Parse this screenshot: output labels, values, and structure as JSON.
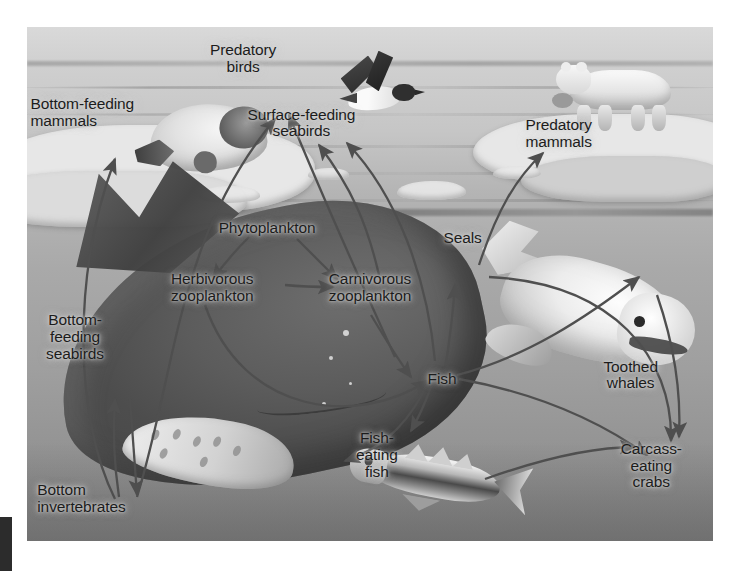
{
  "figure": {
    "kind": "illustration-diagram",
    "style": "grayscale photo-illustration with overlaid text labels and curved arrows"
  },
  "labels": [
    {
      "id": "predatory-birds",
      "text": "Predatory\nbirds",
      "x": 31.5,
      "y": 3.0,
      "align": "center"
    },
    {
      "id": "bottom-feeding-mammals",
      "text": "Bottom-feeding\nmammals",
      "x": 0.5,
      "y": 13.5,
      "align": "left"
    },
    {
      "id": "surface-feeding-seabirds",
      "text": "Surface-feeding\nseabirds",
      "x": 40.0,
      "y": 15.5,
      "align": "center"
    },
    {
      "id": "predatory-mammals",
      "text": "Predatory\nmammals",
      "x": 77.5,
      "y": 17.5,
      "align": "center"
    },
    {
      "id": "phytoplankton",
      "text": "Phytoplankton",
      "x": 35.0,
      "y": 37.5,
      "align": "center"
    },
    {
      "id": "seals",
      "text": "Seals",
      "x": 63.5,
      "y": 39.5,
      "align": "center"
    },
    {
      "id": "herbivorous-zooplankton",
      "text": "Herbivorous\nzooplankton",
      "x": 27.0,
      "y": 47.5,
      "align": "center"
    },
    {
      "id": "carnivorous-zooplankton",
      "text": "Carnivorous\nzooplankton",
      "x": 50.0,
      "y": 47.5,
      "align": "center"
    },
    {
      "id": "bottom-feeding-seabirds",
      "text": "Bottom-\nfeeding\nseabirds",
      "x": 7.0,
      "y": 55.5,
      "align": "center"
    },
    {
      "id": "fish",
      "text": "Fish",
      "x": 60.5,
      "y": 67.0,
      "align": "center"
    },
    {
      "id": "toothed-whales",
      "text": "Toothed\nwhales",
      "x": 88.0,
      "y": 64.5,
      "align": "center"
    },
    {
      "id": "fish-eating-fish",
      "text": "Fish-\neating\nfish",
      "x": 51.0,
      "y": 78.5,
      "align": "center"
    },
    {
      "id": "carcass-eating-crabs",
      "text": "Carcass-\neating\ncrabs",
      "x": 91.0,
      "y": 80.5,
      "align": "center"
    },
    {
      "id": "bottom-invertebrates",
      "text": "Bottom\ninvertebrates",
      "x": 1.5,
      "y": 88.5,
      "align": "left"
    }
  ],
  "food_web": {
    "nodes": [
      "Phytoplankton",
      "Herbivorous zooplankton",
      "Carnivorous zooplankton",
      "Fish",
      "Fish-eating fish",
      "Seals",
      "Toothed whales",
      "Surface-feeding seabirds",
      "Predatory birds",
      "Predatory mammals",
      "Bottom-feeding mammals",
      "Bottom-feeding seabirds",
      "Bottom invertebrates",
      "Carcass-eating crabs"
    ],
    "edges": [
      {
        "from": "Phytoplankton",
        "to": "Herbivorous zooplankton"
      },
      {
        "from": "Phytoplankton",
        "to": "Carnivorous zooplankton"
      },
      {
        "from": "Herbivorous zooplankton",
        "to": "Carnivorous zooplankton"
      },
      {
        "from": "Herbivorous zooplankton",
        "to": "Fish"
      },
      {
        "from": "Carnivorous zooplankton",
        "to": "Fish"
      },
      {
        "from": "Carnivorous zooplankton",
        "to": "Surface-feeding seabirds"
      },
      {
        "from": "Fish",
        "to": "Surface-feeding seabirds"
      },
      {
        "from": "Fish",
        "to": "Fish-eating fish"
      },
      {
        "from": "Fish",
        "to": "Seals"
      },
      {
        "from": "Fish",
        "to": "Toothed whales"
      },
      {
        "from": "Fish",
        "to": "Carcass-eating crabs"
      },
      {
        "from": "Fish-eating fish",
        "to": "Carcass-eating crabs"
      },
      {
        "from": "Seals",
        "to": "Predatory mammals"
      },
      {
        "from": "Seals",
        "to": "Carcass-eating crabs"
      },
      {
        "from": "Toothed whales",
        "to": "Carcass-eating crabs"
      },
      {
        "from": "Surface-feeding seabirds",
        "to": "Predatory birds"
      },
      {
        "from": "Bottom invertebrates",
        "to": "Bottom-feeding mammals"
      },
      {
        "from": "Bottom invertebrates",
        "to": "Bottom-feeding seabirds"
      },
      {
        "from": "Bottom-feeding seabirds",
        "to": "Bottom invertebrates"
      },
      {
        "from": "Bottom invertebrates",
        "to": "Predatory birds"
      }
    ]
  },
  "animals": [
    {
      "id": "ringed-seal",
      "name": "seal resting on ice"
    },
    {
      "id": "polar-bear",
      "name": "polar bear on ice floe"
    },
    {
      "id": "auk-bird",
      "name": "flying seabird"
    },
    {
      "id": "humpback-whale",
      "name": "baleen whale underwater"
    },
    {
      "id": "beluga-whale",
      "name": "beluga / toothed whale"
    },
    {
      "id": "cod-fish",
      "name": "predatory fish"
    }
  ],
  "colors": {
    "text": "#1c1c1c",
    "arrow": "#4f4f4f",
    "page_background": "#ffffff",
    "plate_background": "#b9b9b9",
    "crop_bar": "#2c2c2c"
  }
}
